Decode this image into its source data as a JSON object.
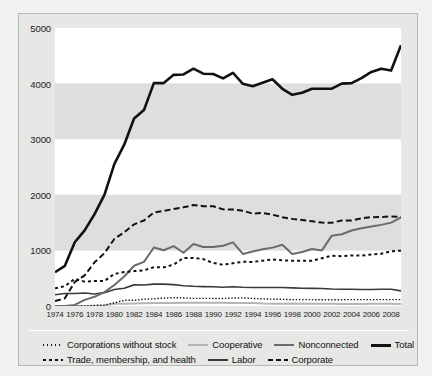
{
  "chart_data": {
    "type": "line",
    "title": "",
    "xlabel": "",
    "ylabel": "",
    "xlim": [
      1974,
      2009
    ],
    "ylim": [
      0,
      5000
    ],
    "grid": "horizontal-bands",
    "legend_position": "bottom",
    "y_ticks": [
      0,
      1000,
      2000,
      3000,
      4000,
      5000
    ],
    "y_tick_labels": [
      "0",
      "1000",
      "2000",
      "3000",
      "4000",
      "5000"
    ],
    "x_tick_labels": [
      "1974",
      "1976",
      "1978",
      "1980",
      "1982",
      "1984",
      "1986",
      "1988",
      "1990",
      "1992",
      "1994",
      "1996",
      "1998",
      "2000",
      "2002",
      "2004",
      "2006",
      "2008"
    ],
    "x": [
      1974,
      1975,
      1976,
      1977,
      1978,
      1979,
      1980,
      1981,
      1982,
      1983,
      1984,
      1985,
      1986,
      1987,
      1988,
      1989,
      1990,
      1991,
      1992,
      1993,
      1994,
      1995,
      1996,
      1997,
      1998,
      1999,
      2000,
      2001,
      2002,
      2003,
      2004,
      2005,
      2006,
      2007,
      2008,
      2009
    ],
    "series": [
      {
        "name": "Total",
        "color": "#111111",
        "style": "solid",
        "width": 2.6,
        "values": [
          608,
          722,
          1146,
          1360,
          1653,
          2000,
          2551,
          2901,
          3371,
          3525,
          4009,
          4009,
          4157,
          4165,
          4268,
          4178,
          4172,
          4094,
          4195,
          3996,
          3954,
          4016,
          4079,
          3907,
          3798,
          3835,
          3907,
          3907,
          3908,
          4000,
          4009,
          4100,
          4210,
          4268,
          4234,
          4690
        ]
      },
      {
        "name": "Corporate",
        "color": "#111111",
        "style": "dashed",
        "width": 2.0,
        "values": [
          89,
          139,
          433,
          550,
          785,
          950,
          1206,
          1327,
          1469,
          1538,
          1682,
          1710,
          1744,
          1775,
          1816,
          1796,
          1795,
          1738,
          1735,
          1715,
          1660,
          1674,
          1642,
          1597,
          1567,
          1548,
          1523,
          1500,
          1497,
          1538,
          1538,
          1578,
          1597,
          1600,
          1612,
          1598
        ]
      },
      {
        "name": "Trade, membership, and health",
        "color": "#111111",
        "style": "dotted-dash",
        "width": 2.0,
        "values": [
          318,
          357,
          489,
          438,
          451,
          450,
          576,
          611,
          628,
          641,
          698,
          695,
          745,
          865,
          865,
          844,
          774,
          742,
          770,
          795,
          792,
          815,
          838,
          821,
          815,
          812,
          812,
          860,
          905,
          895,
          910,
          908,
          925,
          940,
          985,
          995
        ]
      },
      {
        "name": "Nonconnected",
        "color": "#6b6b6b",
        "style": "solid",
        "width": 2.0,
        "values": [
          0,
          0,
          20,
          110,
          165,
          250,
          378,
          531,
          723,
          793,
          1053,
          1003,
          1077,
          957,
          1115,
          1060,
          1062,
          1083,
          1145,
          936,
          980,
          1020,
          1050,
          1103,
          935,
          972,
          1026,
          1000,
          1265,
          1290,
          1357,
          1400,
          1430,
          1459,
          1500,
          1594
        ]
      },
      {
        "name": "Labor",
        "color": "#3a3a3a",
        "style": "solid",
        "width": 1.6,
        "values": [
          201,
          226,
          224,
          234,
          217,
          240,
          297,
          318,
          380,
          378,
          394,
          394,
          384,
          364,
          354,
          349,
          346,
          338,
          347,
          337,
          333,
          334,
          332,
          332,
          326,
          318,
          317,
          316,
          307,
          302,
          302,
          297,
          298,
          301,
          301,
          272
        ]
      },
      {
        "name": "Corporations without stock",
        "color": "#111111",
        "style": "dotted",
        "width": 1.4,
        "values": [
          0,
          0,
          0,
          0,
          12,
          17,
          56,
          103,
          103,
          122,
          130,
          142,
          151,
          145,
          138,
          137,
          136,
          136,
          142,
          146,
          136,
          129,
          123,
          120,
          115,
          114,
          114,
          113,
          111,
          113,
          115,
          114,
          114,
          114,
          115,
          115
        ]
      },
      {
        "name": "Cooperative",
        "color": "#b4b4b2",
        "style": "solid",
        "width": 2.0,
        "values": [
          0,
          0,
          0,
          0,
          0,
          8,
          42,
          41,
          47,
          51,
          52,
          54,
          56,
          59,
          59,
          59,
          59,
          57,
          56,
          53,
          53,
          44,
          42,
          42,
          45,
          41,
          42,
          39,
          39,
          38,
          38,
          38,
          39,
          41,
          41,
          38
        ]
      }
    ]
  },
  "legend": {
    "row1": [
      {
        "label": "Corporations without stock",
        "key": "corporations-without-stock"
      },
      {
        "label": "Cooperative",
        "key": "cooperative"
      },
      {
        "label": "Nonconnected",
        "key": "nonconnected"
      },
      {
        "label": "Total",
        "key": "total"
      }
    ],
    "row2": [
      {
        "label": "Trade, membership, and health",
        "key": "trade-membership-and-health"
      },
      {
        "label": "Labor",
        "key": "labor"
      },
      {
        "label": "Corporate",
        "key": "corporate"
      }
    ]
  }
}
